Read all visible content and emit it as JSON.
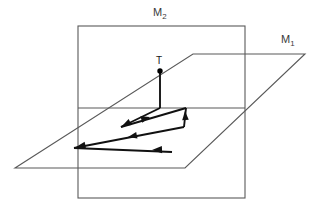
{
  "figure": {
    "kind": "geometry-diagram",
    "background_color": "#ffffff",
    "plane_stroke_color": "#555555",
    "path_stroke_color": "#111111",
    "point_color": "#000000"
  },
  "labels": {
    "plane_vertical": {
      "base": "M",
      "subscript": "2"
    },
    "plane_horizontal": {
      "base": "M",
      "subscript": "1"
    },
    "source_point": "T"
  },
  "geometry": {
    "plane_m2_rect": {
      "left": 78,
      "top": 26,
      "right": 245,
      "bottom": 198
    },
    "plane_m1_parallelogram": [
      [
        78,
        108
      ],
      [
        245,
        108
      ],
      [
        305,
        54
      ],
      [
        193,
        54
      ]
    ],
    "intersection_line": {
      "x1": 78,
      "y1": 108,
      "x2": 245,
      "y2": 108
    },
    "point_t": {
      "x": 160,
      "y": 71,
      "radius": 2.6
    },
    "stem_t": {
      "x1": 160,
      "y1": 71,
      "x2": 160,
      "y2": 108
    },
    "ray_path": [
      [
        160,
        108
      ],
      [
        122,
        126
      ],
      [
        185,
        108
      ],
      [
        184,
        126
      ],
      [
        75,
        148
      ],
      [
        172,
        152
      ]
    ],
    "arrow_markers": [
      {
        "at": [
          124,
          124
        ],
        "angle_deg": 155,
        "name": "arrow-down-left"
      },
      {
        "at": [
          148,
          117
        ],
        "angle_deg": -17,
        "name": "arrow-up-right"
      },
      {
        "at": [
          185,
          113
        ],
        "angle_deg": -92,
        "name": "arrow-up"
      },
      {
        "at": [
          130,
          137
        ],
        "angle_deg": 168,
        "name": "arrow-down-left-mid"
      },
      {
        "at": [
          78,
          147
        ],
        "angle_deg": 168,
        "name": "arrow-left-vertex"
      },
      {
        "at": [
          155,
          150
        ],
        "angle_deg": 180,
        "name": "arrow-left-return"
      }
    ]
  }
}
